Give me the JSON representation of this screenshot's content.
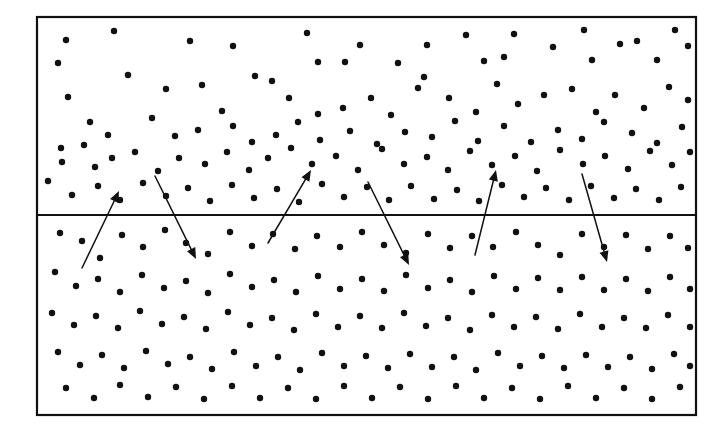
{
  "figure": {
    "type": "scatter-diagram",
    "title": "",
    "caption": "",
    "background_color": "#ffffff",
    "ink_color": "#111111",
    "frame": {
      "name": "outer-rectangle",
      "x": 37,
      "y": 17,
      "width": 659,
      "height": 398,
      "stroke_width": 2.2,
      "stroke_color": "#111111",
      "fill": "#ffffff"
    },
    "divider": {
      "name": "interface-line",
      "x1": 37,
      "y1": 215,
      "x2": 696,
      "y2": 215,
      "stroke_width": 2.2,
      "stroke_color": "#111111"
    },
    "regions": [
      {
        "name": "upper-region",
        "label": "",
        "y_top": 17,
        "y_bottom": 215
      },
      {
        "name": "lower-region",
        "label": "",
        "y_top": 215,
        "y_bottom": 415
      }
    ],
    "dot_style": {
      "radius": 3.2,
      "fill": "#111111"
    }
  },
  "chart_data": {
    "type": "scatter",
    "title": "",
    "xlabel": "",
    "ylabel": "",
    "xlim": [
      37,
      696
    ],
    "ylim": [
      17,
      415
    ],
    "grid": false,
    "legend": "none",
    "series": [
      {
        "name": "upper-region-particles",
        "marker": "filled-circle",
        "color": "#111111",
        "points": [
          [
            66,
            40
          ],
          [
            114,
            31
          ],
          [
            190,
            41
          ],
          [
            233,
            46
          ],
          [
            255,
            76
          ],
          [
            307,
            33
          ],
          [
            318,
            62
          ],
          [
            345,
            62
          ],
          [
            360,
            45
          ],
          [
            398,
            63
          ],
          [
            424,
            77
          ],
          [
            427,
            45
          ],
          [
            466,
            35
          ],
          [
            484,
            61
          ],
          [
            504,
            57
          ],
          [
            514,
            34
          ],
          [
            553,
            47
          ],
          [
            584,
            30
          ],
          [
            592,
            60
          ],
          [
            620,
            44
          ],
          [
            637,
            41
          ],
          [
            657,
            60
          ],
          [
            675,
            30
          ],
          [
            688,
            46
          ],
          [
            58,
            63
          ],
          [
            128,
            75
          ],
          [
            166,
            89
          ],
          [
            202,
            85
          ],
          [
            222,
            111
          ],
          [
            272,
            81
          ],
          [
            289,
            98
          ],
          [
            318,
            114
          ],
          [
            343,
            108
          ],
          [
            371,
            98
          ],
          [
            391,
            115
          ],
          [
            418,
            88
          ],
          [
            449,
            98
          ],
          [
            476,
            112
          ],
          [
            497,
            84
          ],
          [
            518,
            104
          ],
          [
            544,
            95
          ],
          [
            572,
            89
          ],
          [
            596,
            112
          ],
          [
            615,
            95
          ],
          [
            644,
            108
          ],
          [
            669,
            87
          ],
          [
            688,
            100
          ],
          [
            68,
            97
          ],
          [
            90,
            122
          ],
          [
            108,
            135
          ],
          [
            152,
            118
          ],
          [
            175,
            136
          ],
          [
            198,
            130
          ],
          [
            233,
            126
          ],
          [
            252,
            142
          ],
          [
            276,
            135
          ],
          [
            298,
            122
          ],
          [
            320,
            140
          ],
          [
            350,
            131
          ],
          [
            377,
            144
          ],
          [
            405,
            132
          ],
          [
            432,
            137
          ],
          [
            455,
            121
          ],
          [
            478,
            141
          ],
          [
            504,
            126
          ],
          [
            531,
            142
          ],
          [
            558,
            130
          ],
          [
            582,
            139
          ],
          [
            604,
            122
          ],
          [
            632,
            133
          ],
          [
            657,
            143
          ],
          [
            682,
            127
          ],
          [
            61,
            148
          ],
          [
            62,
            162
          ],
          [
            84,
            145
          ],
          [
            95,
            167
          ],
          [
            112,
            158
          ],
          [
            135,
            152
          ],
          [
            158,
            171
          ],
          [
            179,
            158
          ],
          [
            205,
            164
          ],
          [
            227,
            152
          ],
          [
            249,
            170
          ],
          [
            268,
            158
          ],
          [
            291,
            148
          ],
          [
            312,
            164
          ],
          [
            336,
            156
          ],
          [
            358,
            170
          ],
          [
            382,
            149
          ],
          [
            404,
            164
          ],
          [
            427,
            157
          ],
          [
            448,
            170
          ],
          [
            470,
            151
          ],
          [
            492,
            165
          ],
          [
            515,
            156
          ],
          [
            537,
            171
          ],
          [
            560,
            150
          ],
          [
            583,
            164
          ],
          [
            605,
            156
          ],
          [
            628,
            169
          ],
          [
            650,
            151
          ],
          [
            672,
            165
          ],
          [
            690,
            152
          ],
          [
            48,
            181
          ],
          [
            72,
            195
          ],
          [
            98,
            186
          ],
          [
            120,
            200
          ],
          [
            143,
            183
          ],
          [
            166,
            196
          ],
          [
            188,
            188
          ],
          [
            210,
            201
          ],
          [
            232,
            185
          ],
          [
            254,
            198
          ],
          [
            277,
            189
          ],
          [
            299,
            202
          ],
          [
            322,
            184
          ],
          [
            344,
            197
          ],
          [
            367,
            187
          ],
          [
            389,
            200
          ],
          [
            411,
            186
          ],
          [
            434,
            199
          ],
          [
            457,
            190
          ],
          [
            479,
            201
          ],
          [
            502,
            185
          ],
          [
            524,
            197
          ],
          [
            546,
            188
          ],
          [
            569,
            200
          ],
          [
            591,
            186
          ],
          [
            614,
            198
          ],
          [
            636,
            189
          ],
          [
            659,
            200
          ],
          [
            681,
            187
          ]
        ]
      },
      {
        "name": "lower-region-particles",
        "marker": "filled-circle",
        "color": "#111111",
        "points": [
          [
            60,
            233
          ],
          [
            82,
            241
          ],
          [
            100,
            258
          ],
          [
            122,
            235
          ],
          [
            143,
            247
          ],
          [
            165,
            230
          ],
          [
            186,
            243
          ],
          [
            208,
            254
          ],
          [
            230,
            232
          ],
          [
            252,
            246
          ],
          [
            273,
            234
          ],
          [
            295,
            249
          ],
          [
            317,
            236
          ],
          [
            340,
            247
          ],
          [
            362,
            232
          ],
          [
            384,
            245
          ],
          [
            406,
            253
          ],
          [
            428,
            234
          ],
          [
            450,
            248
          ],
          [
            472,
            236
          ],
          [
            493,
            247
          ],
          [
            516,
            232
          ],
          [
            538,
            245
          ],
          [
            560,
            255
          ],
          [
            582,
            234
          ],
          [
            604,
            247
          ],
          [
            626,
            235
          ],
          [
            648,
            249
          ],
          [
            670,
            236
          ],
          [
            688,
            248
          ],
          [
            55,
            272
          ],
          [
            76,
            286
          ],
          [
            98,
            279
          ],
          [
            120,
            292
          ],
          [
            142,
            275
          ],
          [
            164,
            288
          ],
          [
            186,
            281
          ],
          [
            208,
            293
          ],
          [
            230,
            274
          ],
          [
            252,
            287
          ],
          [
            274,
            280
          ],
          [
            296,
            292
          ],
          [
            318,
            276
          ],
          [
            340,
            289
          ],
          [
            362,
            279
          ],
          [
            384,
            291
          ],
          [
            406,
            275
          ],
          [
            428,
            288
          ],
          [
            450,
            280
          ],
          [
            472,
            292
          ],
          [
            494,
            276
          ],
          [
            516,
            289
          ],
          [
            538,
            278
          ],
          [
            560,
            290
          ],
          [
            582,
            277
          ],
          [
            604,
            290
          ],
          [
            626,
            279
          ],
          [
            648,
            291
          ],
          [
            670,
            277
          ],
          [
            690,
            289
          ],
          [
            52,
            313
          ],
          [
            74,
            325
          ],
          [
            96,
            316
          ],
          [
            118,
            328
          ],
          [
            140,
            311
          ],
          [
            162,
            324
          ],
          [
            184,
            317
          ],
          [
            206,
            329
          ],
          [
            228,
            312
          ],
          [
            250,
            325
          ],
          [
            272,
            318
          ],
          [
            294,
            330
          ],
          [
            316,
            314
          ],
          [
            338,
            327
          ],
          [
            360,
            316
          ],
          [
            382,
            328
          ],
          [
            404,
            313
          ],
          [
            426,
            326
          ],
          [
            448,
            318
          ],
          [
            470,
            330
          ],
          [
            492,
            315
          ],
          [
            514,
            327
          ],
          [
            536,
            317
          ],
          [
            558,
            329
          ],
          [
            580,
            314
          ],
          [
            602,
            327
          ],
          [
            624,
            318
          ],
          [
            646,
            328
          ],
          [
            668,
            315
          ],
          [
            690,
            327
          ],
          [
            58,
            352
          ],
          [
            80,
            365
          ],
          [
            102,
            355
          ],
          [
            124,
            368
          ],
          [
            146,
            351
          ],
          [
            168,
            364
          ],
          [
            190,
            357
          ],
          [
            212,
            369
          ],
          [
            234,
            352
          ],
          [
            256,
            366
          ],
          [
            278,
            357
          ],
          [
            300,
            370
          ],
          [
            322,
            353
          ],
          [
            344,
            366
          ],
          [
            366,
            356
          ],
          [
            388,
            368
          ],
          [
            410,
            354
          ],
          [
            432,
            367
          ],
          [
            454,
            357
          ],
          [
            476,
            370
          ],
          [
            498,
            353
          ],
          [
            520,
            366
          ],
          [
            542,
            356
          ],
          [
            564,
            368
          ],
          [
            586,
            355
          ],
          [
            608,
            367
          ],
          [
            630,
            357
          ],
          [
            652,
            369
          ],
          [
            674,
            354
          ],
          [
            690,
            366
          ],
          [
            66,
            388
          ],
          [
            94,
            398
          ],
          [
            120,
            385
          ],
          [
            148,
            397
          ],
          [
            176,
            387
          ],
          [
            204,
            399
          ],
          [
            232,
            386
          ],
          [
            260,
            398
          ],
          [
            288,
            388
          ],
          [
            316,
            399
          ],
          [
            344,
            386
          ],
          [
            372,
            398
          ],
          [
            400,
            387
          ],
          [
            428,
            399
          ],
          [
            456,
            386
          ],
          [
            484,
            398
          ],
          [
            512,
            388
          ],
          [
            540,
            399
          ],
          [
            568,
            386
          ],
          [
            596,
            398
          ],
          [
            624,
            388
          ],
          [
            652,
            399
          ],
          [
            680,
            387
          ]
        ]
      }
    ],
    "annotations": [
      {
        "name": "arrow-1-upward",
        "type": "arrow",
        "direction": "up-right",
        "from": [
          82,
          268
        ],
        "to": [
          119,
          191
        ]
      },
      {
        "name": "arrow-2-downward",
        "type": "arrow",
        "direction": "down-right",
        "from": [
          155,
          176
        ],
        "to": [
          196,
          259
        ]
      },
      {
        "name": "arrow-3-upward",
        "type": "arrow",
        "direction": "up-right",
        "from": [
          268,
          243
        ],
        "to": [
          311,
          170
        ]
      },
      {
        "name": "arrow-4-downward",
        "type": "arrow",
        "direction": "down-right",
        "from": [
          368,
          182
        ],
        "to": [
          409,
          265
        ]
      },
      {
        "name": "arrow-5-upward",
        "type": "arrow",
        "direction": "up-right",
        "from": [
          475,
          255
        ],
        "to": [
          496,
          170
        ]
      },
      {
        "name": "arrow-6-downward",
        "type": "arrow",
        "direction": "down-right",
        "from": [
          582,
          174
        ],
        "to": [
          607,
          262
        ]
      }
    ]
  }
}
